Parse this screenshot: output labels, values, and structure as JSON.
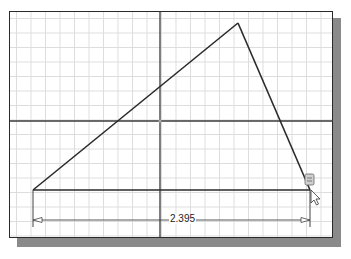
{
  "sketch": {
    "dimension_value": "2.395",
    "colors": {
      "grid": "#dcdcdc",
      "axis": "#3a3a3a",
      "geometry": "#2a2a2a",
      "frame": "#2a2a2a",
      "shadow": "#8a8a8a",
      "dimension": "#444444"
    },
    "icons": [
      "constraint-glyph-icon",
      "cursor-arrow-icon"
    ]
  }
}
